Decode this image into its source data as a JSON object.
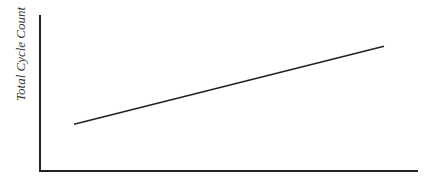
{
  "chart_data": {
    "type": "line",
    "title": "",
    "xlabel": "",
    "ylabel": "Total Cycle Count",
    "grid": false,
    "legend": null,
    "series": [
      {
        "name": "Total Cycle Count",
        "x": [
          0.09,
          0.91
        ],
        "values": [
          0.3,
          0.8
        ]
      }
    ],
    "xlim": [
      0,
      1
    ],
    "ylim": [
      0,
      1
    ],
    "ticks": "none",
    "colors": {
      "line": "#222222",
      "axes": "#222222",
      "text": "#333333"
    }
  }
}
